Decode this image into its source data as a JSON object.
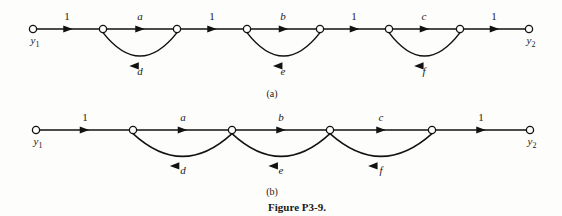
{
  "figure": {
    "caption": "Figure P3-9.",
    "subcaption_a": "(a)",
    "subcaption_b": "(b)",
    "terminal_labels": {
      "input": "y",
      "input_sub": "1",
      "output": "y",
      "output_sub": "2"
    }
  },
  "graph_a": {
    "name": "signal-flow-graph-a",
    "nodes": [
      {
        "id": "n1",
        "x": 33,
        "y": 29,
        "label": "y1"
      },
      {
        "id": "n2",
        "x": 103,
        "y": 29,
        "label": ""
      },
      {
        "id": "n3",
        "x": 177,
        "y": 29,
        "label": ""
      },
      {
        "id": "n4",
        "x": 247,
        "y": 29,
        "label": ""
      },
      {
        "id": "n5",
        "x": 320,
        "y": 29,
        "label": ""
      },
      {
        "id": "n6",
        "x": 389,
        "y": 29,
        "label": ""
      },
      {
        "id": "n7",
        "x": 460,
        "y": 29,
        "label": ""
      },
      {
        "id": "n8",
        "x": 529,
        "y": 29,
        "label": "y2"
      }
    ],
    "forward_edges": [
      {
        "from": "n1",
        "to": "n2",
        "label": "1",
        "numeric": true,
        "label_x": 67,
        "label_y": 20
      },
      {
        "from": "n2",
        "to": "n3",
        "label": "a",
        "numeric": false,
        "label_x": 140,
        "label_y": 20
      },
      {
        "from": "n3",
        "to": "n4",
        "label": "1",
        "numeric": true,
        "label_x": 212,
        "label_y": 20
      },
      {
        "from": "n4",
        "to": "n5",
        "label": "b",
        "numeric": false,
        "label_x": 283,
        "label_y": 20
      },
      {
        "from": "n5",
        "to": "n6",
        "label": "1",
        "numeric": true,
        "label_x": 354,
        "label_y": 20
      },
      {
        "from": "n6",
        "to": "n7",
        "label": "c",
        "numeric": false,
        "label_x": 424,
        "label_y": 20
      },
      {
        "from": "n7",
        "to": "n8",
        "label": "1",
        "numeric": true,
        "label_x": 494,
        "label_y": 20
      }
    ],
    "feedback_arcs": [
      {
        "from": "n3",
        "to": "n2",
        "label": "d",
        "label_x": 140,
        "label_y": 75,
        "depth": 34
      },
      {
        "from": "n5",
        "to": "n4",
        "label": "e",
        "label_x": 283,
        "label_y": 75,
        "depth": 34
      },
      {
        "from": "n7",
        "to": "n6",
        "label": "f",
        "label_x": 424,
        "label_y": 75,
        "depth": 34
      }
    ]
  },
  "graph_b": {
    "name": "signal-flow-graph-b",
    "nodes": [
      {
        "id": "m1",
        "x": 36,
        "y": 130,
        "label": "y1"
      },
      {
        "id": "m2",
        "x": 133,
        "y": 130,
        "label": ""
      },
      {
        "id": "m3",
        "x": 232,
        "y": 130,
        "label": ""
      },
      {
        "id": "m4",
        "x": 330,
        "y": 130,
        "label": ""
      },
      {
        "id": "m5",
        "x": 432,
        "y": 130,
        "label": ""
      },
      {
        "id": "m6",
        "x": 530,
        "y": 130,
        "label": "y2"
      }
    ],
    "forward_edges": [
      {
        "from": "m1",
        "to": "m2",
        "label": "1",
        "numeric": true,
        "label_x": 85,
        "label_y": 121
      },
      {
        "from": "m2",
        "to": "m3",
        "label": "a",
        "numeric": false,
        "label_x": 183,
        "label_y": 121
      },
      {
        "from": "m3",
        "to": "m4",
        "label": "b",
        "numeric": false,
        "label_x": 281,
        "label_y": 121
      },
      {
        "from": "m4",
        "to": "m5",
        "label": "c",
        "numeric": false,
        "label_x": 381,
        "label_y": 121
      },
      {
        "from": "m5",
        "to": "m6",
        "label": "1",
        "numeric": true,
        "label_x": 481,
        "label_y": 121
      }
    ],
    "feedback_arcs": [
      {
        "from": "m3",
        "to": "m2",
        "label": "d",
        "label_x": 183,
        "label_y": 174,
        "depth": 33
      },
      {
        "from": "m4",
        "to": "m3",
        "label": "e",
        "label_x": 281,
        "label_y": 174,
        "depth": 33
      },
      {
        "from": "m5",
        "to": "m4",
        "label": "f",
        "label_x": 381,
        "label_y": 174,
        "depth": 33
      }
    ]
  },
  "layout": {
    "subcaption_a_x": 272,
    "subcaption_a_y": 97,
    "subcaption_b_x": 272,
    "subcaption_b_y": 195,
    "caption_x": 297,
    "caption_y": 211,
    "node_radius": 3.6
  }
}
